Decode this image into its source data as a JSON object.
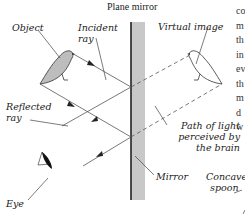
{
  "diagram": {
    "title": "Plane mirror",
    "labels": {
      "object": "Object",
      "incident_ray_1": "Incident",
      "incident_ray_2": "ray",
      "virtual_image": "Virtual image",
      "reflected_ray_1": "Reflected",
      "reflected_ray_2": "ray",
      "path_1": "Path of light",
      "path_2": "perceived by",
      "path_3": "the brain",
      "mirror": "Mirror",
      "eye": "Eye",
      "concave_1": "Concave",
      "concave_2": "spoon"
    },
    "side_text_fragments": [
      "co",
      "m",
      "th",
      "in",
      "ev",
      "th",
      "m",
      "d",
      "w"
    ],
    "colors": {
      "line": "#555555",
      "mirror_edge": "#222222",
      "mirror_fill": "#c8c8c8",
      "bird_fill": "#bdbdbd"
    }
  }
}
